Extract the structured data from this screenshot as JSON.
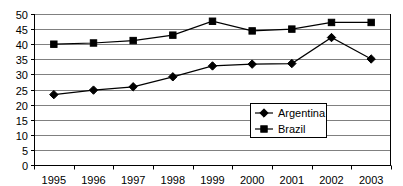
{
  "chart_data": {
    "type": "line",
    "title": "",
    "subtitle": "",
    "xlabel": "",
    "ylabel": "",
    "categories": [
      "1995",
      "1996",
      "1997",
      "1998",
      "1999",
      "2000",
      "2001",
      "2002",
      "2003"
    ],
    "series": [
      {
        "name": "Argentina",
        "marker": "diamond",
        "color": "#000000",
        "values": [
          23.3,
          24.8,
          25.9,
          29.2,
          32.8,
          33.4,
          33.6,
          42.2,
          35.1
        ]
      },
      {
        "name": "Brazil",
        "marker": "square",
        "color": "#000000",
        "values": [
          40.0,
          40.4,
          41.2,
          43.0,
          47.6,
          44.4,
          45.0,
          47.2,
          47.2
        ]
      }
    ],
    "ylim": [
      0,
      50
    ],
    "ytick_step": 5,
    "yticks": [
      "0",
      "5",
      "10",
      "15",
      "20",
      "25",
      "30",
      "35",
      "40",
      "45",
      "50"
    ],
    "grid": true,
    "grid_axis": "y",
    "legend_position": "inside-bottom-right",
    "legend_entries": [
      "Argentina",
      "Brazil"
    ],
    "plot_border": true,
    "background": "#ffffff",
    "grid_color": "#808080",
    "axis_color": "#000000"
  }
}
